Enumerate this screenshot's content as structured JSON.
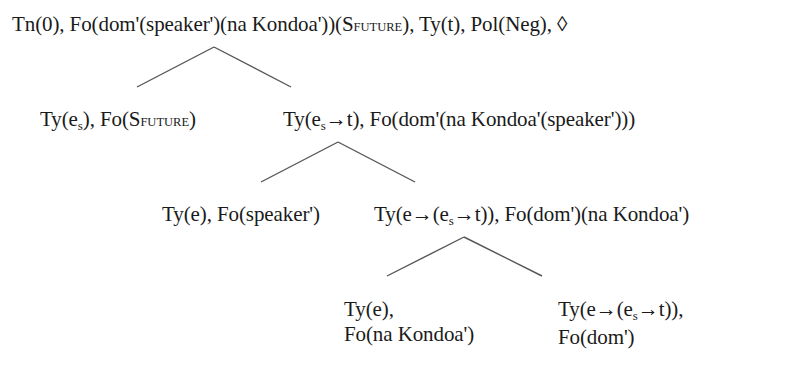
{
  "diagram": {
    "type": "tree",
    "line_color": "#555555",
    "text_color": "#1a1a1a",
    "root": {
      "text_pre": "Tn(0), Fo(dom'(speaker')(na Kondoa'))(S",
      "text_smallcaps": "FUTURE",
      "text_post": "), Ty(t), Pol(Neg), ◊"
    },
    "level1_left": {
      "p1": "Ty(e",
      "sub": "s",
      "p2": "), Fo(S",
      "smallcaps": "FUTURE",
      "p3": ")"
    },
    "level1_right": {
      "p1": "Ty(e",
      "sub": "s",
      "p2": "→t), Fo(dom'(na Kondoa'(speaker')))"
    },
    "level2_left": {
      "text": "Ty(e), Fo(speaker')"
    },
    "level2_right": {
      "p1": "Ty(e→(e",
      "sub": "s",
      "p2": "→t)), Fo(dom')(na Kondoa')"
    },
    "level3_left": {
      "line1": "Ty(e),",
      "line2": "Fo(na Kondoa')"
    },
    "level3_right": {
      "line1_p1": "Ty(e→(e",
      "line1_sub": "s",
      "line1_p2": "→t)),",
      "line2": "Fo(dom')"
    }
  }
}
